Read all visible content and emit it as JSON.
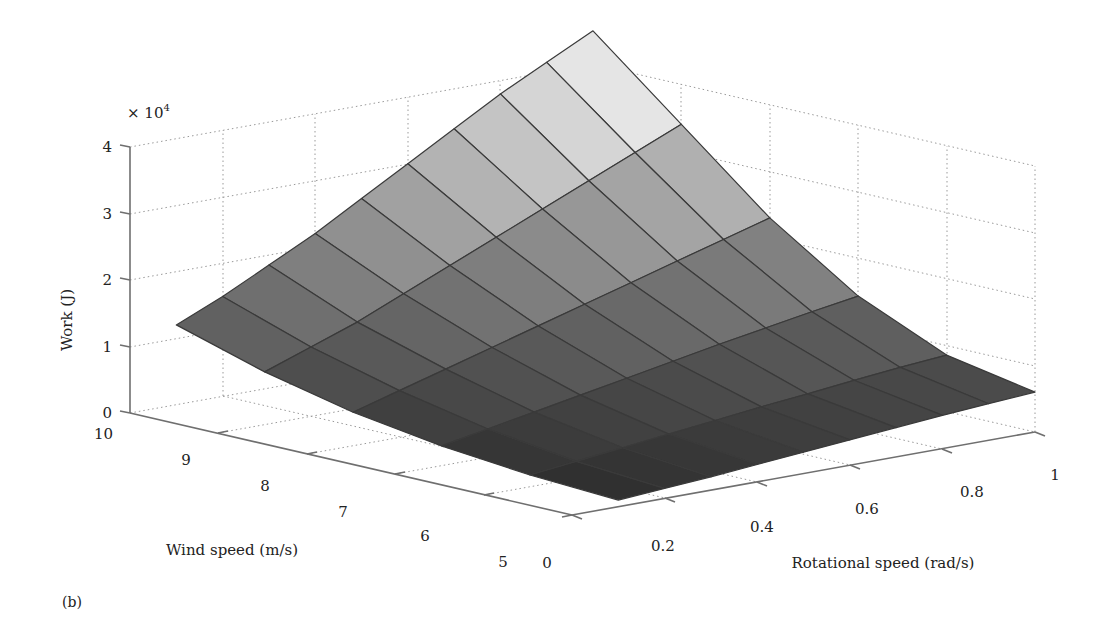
{
  "figure": {
    "panel_label": "(b)",
    "multiplier": "× 10",
    "multiplier_exp": "4"
  },
  "chart_data": {
    "type": "surface3d",
    "title": "",
    "xlabel": "Rotational speed (rad/s)",
    "ylabel": "Wind speed (m/s)",
    "zlabel": "Work (J)",
    "z_multiplier": "× 10^4",
    "x_ticks": [
      "0",
      "0.2",
      "0.4",
      "0.6",
      "0.8",
      "1"
    ],
    "y_ticks": [
      "5",
      "6",
      "7",
      "8",
      "9",
      "10"
    ],
    "z_ticks": [
      "0",
      "1",
      "2",
      "3",
      "4"
    ],
    "xlim": [
      0,
      1
    ],
    "ylim": [
      5,
      10
    ],
    "zlim": [
      0,
      40000
    ],
    "grid": true,
    "colormap": "gray",
    "x": [
      0.1,
      0.2,
      0.3,
      0.4,
      0.5,
      0.6,
      0.7,
      0.8,
      0.9,
      1.0
    ],
    "y": [
      5,
      6,
      7,
      8,
      9,
      10
    ],
    "z": [
      [
        1000,
        1500,
        2000,
        2600,
        3200,
        3800,
        4400,
        5000,
        5500,
        6000
      ],
      [
        1700,
        2500,
        3300,
        4100,
        4900,
        5700,
        6400,
        7200,
        7900,
        8500
      ],
      [
        3000,
        4300,
        5600,
        6900,
        8200,
        9500,
        10800,
        12000,
        13200,
        14300
      ],
      [
        5000,
        7000,
        9000,
        11000,
        13000,
        15000,
        17000,
        19000,
        21000,
        23000
      ],
      [
        8000,
        10500,
        13000,
        16000,
        19000,
        22000,
        25000,
        28000,
        31000,
        34000
      ],
      [
        12000,
        15000,
        18500,
        22000,
        26000,
        30000,
        34000,
        38000,
        41500,
        45000
      ]
    ]
  }
}
